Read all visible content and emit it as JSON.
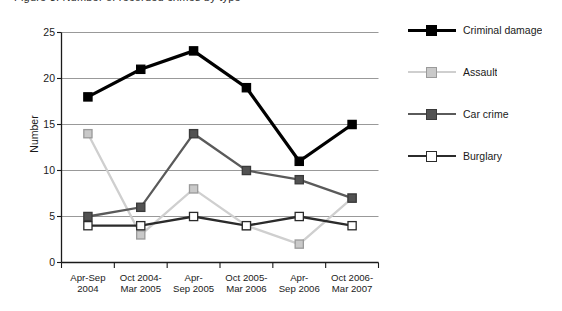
{
  "title_fragment": "Figure 3: Number of recorded crimes by type",
  "chart_data": {
    "type": "line",
    "title": "",
    "xlabel": "",
    "ylabel": "Number",
    "ylim": [
      0,
      25
    ],
    "yticks": [
      0,
      5,
      10,
      15,
      20,
      25
    ],
    "grid": true,
    "legend_position": "right",
    "categories": [
      "Apr-Sep 2004",
      "Oct 2004-Mar 2005",
      "Apr-Sep 2005",
      "Oct 2005-Mar 2006",
      "Apr-Sep 2006",
      "Oct 2006-Mar 2007"
    ],
    "categories_lines": [
      [
        "Apr-Sep",
        "2004"
      ],
      [
        "Oct 2004-",
        "Mar 2005"
      ],
      [
        "Apr-",
        "Sep 2005"
      ],
      [
        "Oct 2005-",
        "Mar 2006"
      ],
      [
        "Apr-",
        "Sep 2006"
      ],
      [
        "Oct 2006-",
        "Mar 2007"
      ]
    ],
    "series": [
      {
        "name": "Criminal damage",
        "values": [
          18,
          21,
          23,
          19,
          11,
          15
        ],
        "line_color": "#000000",
        "marker_fill": "#000000",
        "marker_edge": "#000000"
      },
      {
        "name": "Assault",
        "values": [
          14,
          3,
          8,
          4,
          2,
          7
        ],
        "line_color": "#cfcfcf",
        "marker_fill": "#c9c9c9",
        "marker_edge": "#9a9a9a"
      },
      {
        "name": "Car crime",
        "values": [
          5,
          6,
          14,
          10,
          9,
          7
        ],
        "line_color": "#5a5a5a",
        "marker_fill": "#525252",
        "marker_edge": "#3a3a3a"
      },
      {
        "name": "Burglary",
        "values": [
          4,
          4,
          5,
          4,
          5,
          4
        ],
        "line_color": "#2b2b2b",
        "marker_fill": "#ffffff",
        "marker_edge": "#2b2b2b"
      }
    ]
  },
  "legend": {
    "items": [
      {
        "label": "Criminal damage"
      },
      {
        "label": "Assault"
      },
      {
        "label": "Car crime"
      },
      {
        "label": "Burglary"
      }
    ]
  },
  "axis": {
    "y_label": "Number",
    "y_tick_labels": [
      "0",
      "5",
      "10",
      "15",
      "20",
      "25"
    ]
  }
}
